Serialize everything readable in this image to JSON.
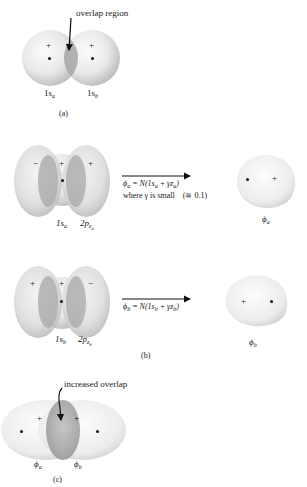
{
  "figure": {
    "panel_a": {
      "caption": "(a)",
      "annotation": "overlap region",
      "labels": {
        "left": "1s",
        "left_sub": "a",
        "right": "1s",
        "right_sub": "b"
      },
      "signs": {
        "left": "+",
        "right": "+"
      }
    },
    "panel_b": {
      "caption": "(b)",
      "row1": {
        "signs": {
          "left_lobe": "−",
          "center": "+",
          "right_lobe": "+"
        },
        "labels": {
          "s": "1s",
          "s_sub": "a",
          "p": "2p",
          "p_sub": "z",
          "p_subsub": "a"
        },
        "equation_lhs": "ϕ",
        "equation_lhs_sub": "a",
        "equation_rhs_pre": " = N(1s",
        "equation_rhs_sub1": "a",
        "equation_rhs_mid": " + γz",
        "equation_rhs_sub2": "a",
        "equation_rhs_post": ")",
        "note": "where γ is small",
        "note_value": "(≅ 0.1)",
        "result_label": "ϕ",
        "result_sub": "a",
        "result_sign": "+"
      },
      "row2": {
        "signs": {
          "left_lobe": "+",
          "center": "+",
          "right_lobe": "−"
        },
        "labels": {
          "s": "1s",
          "s_sub": "b",
          "p": "2p",
          "p_sub": "z",
          "p_subsub": "b"
        },
        "equation_lhs": "ϕ",
        "equation_lhs_sub": "b",
        "equation_rhs_pre": " = N(1s",
        "equation_rhs_sub1": "b",
        "equation_rhs_mid": " + γz",
        "equation_rhs_sub2": "b",
        "equation_rhs_post": ")",
        "result_label": "ϕ",
        "result_sub": "b",
        "result_sign": "+"
      }
    },
    "panel_c": {
      "caption": "(c)",
      "annotation": "increased overlap",
      "labels": {
        "left": "ϕ",
        "left_sub": "a",
        "right": "ϕ",
        "right_sub": "b"
      },
      "signs": {
        "left": "+",
        "right": "+"
      }
    },
    "colors": {
      "orbital_light": "#f4f4f4",
      "orbital_mid": "#d6d6d6",
      "orbital_edge": "#b8b8b8",
      "overlap": "#a9a9a9",
      "ink": "#111111"
    }
  }
}
